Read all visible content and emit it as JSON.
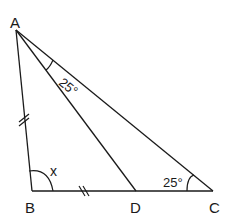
{
  "diagram": {
    "type": "geometry-triangle",
    "stroke_color": "#1a1a1a",
    "background": "#ffffff",
    "vertices": {
      "A": {
        "label": "A",
        "x": 16,
        "y": 30
      },
      "B": {
        "label": "B",
        "x": 32,
        "y": 191
      },
      "C": {
        "label": "C",
        "x": 213,
        "y": 191
      },
      "D": {
        "label": "D",
        "x": 136,
        "y": 191
      }
    },
    "segments": [
      "AB",
      "BC",
      "CA",
      "AD"
    ],
    "equal_marks": {
      "style": "double-tick",
      "segments": [
        "AB",
        "BD"
      ]
    },
    "angles": {
      "DAC": {
        "label": "25°"
      },
      "ACB": {
        "label": "25°"
      },
      "ABC": {
        "label": "x"
      }
    }
  }
}
